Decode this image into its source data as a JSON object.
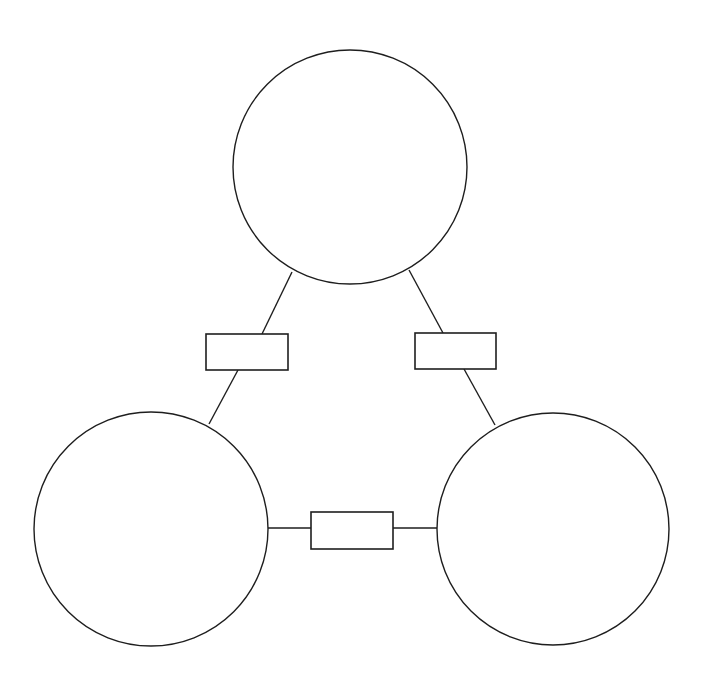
{
  "diagram": {
    "type": "triangle-relationship-diagram",
    "canvas": {
      "width": 702,
      "height": 694,
      "background": "#ffffff"
    },
    "stroke_color": "#1e1e1e",
    "nodes": [
      {
        "id": "top",
        "shape": "circle",
        "cx": 350,
        "cy": 167,
        "r": 117,
        "label": ""
      },
      {
        "id": "bottom-left",
        "shape": "circle",
        "cx": 151,
        "cy": 529,
        "r": 117,
        "label": ""
      },
      {
        "id": "bottom-right",
        "shape": "circle",
        "cx": 553,
        "cy": 529,
        "r": 116,
        "label": ""
      }
    ],
    "connectors": [
      {
        "id": "top-to-bottom-left",
        "from": "top",
        "to": "bottom-left",
        "segments": [
          [
            292,
            272,
            262,
            334
          ],
          [
            238,
            370,
            209,
            424
          ]
        ],
        "box": {
          "x": 206,
          "y": 334,
          "width": 82,
          "height": 36,
          "label": ""
        }
      },
      {
        "id": "top-to-bottom-right",
        "from": "top",
        "to": "bottom-right",
        "segments": [
          [
            409,
            270,
            443,
            333
          ],
          [
            464,
            369,
            495,
            425
          ]
        ],
        "box": {
          "x": 415,
          "y": 333,
          "width": 81,
          "height": 36,
          "label": ""
        }
      },
      {
        "id": "bottom-left-to-bottom-right",
        "from": "bottom-left",
        "to": "bottom-right",
        "segments": [
          [
            268,
            528,
            311,
            528
          ],
          [
            393,
            528,
            437,
            528
          ]
        ],
        "box": {
          "x": 311,
          "y": 512,
          "width": 82,
          "height": 37,
          "label": ""
        }
      }
    ]
  }
}
